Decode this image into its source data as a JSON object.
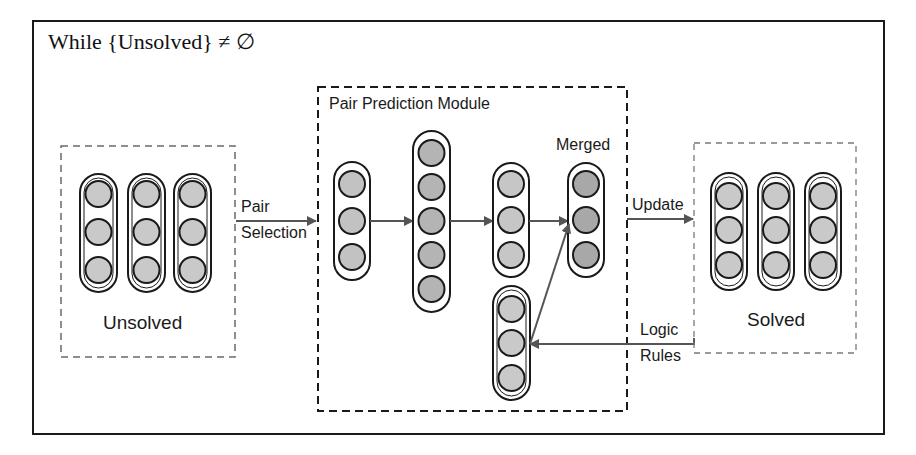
{
  "diagram": {
    "loop_condition": "While {Unsolved} ≠ ∅",
    "groups": {
      "unsolved": {
        "label": "Unsolved",
        "columns": 3,
        "nodes_per_column": 3
      },
      "pair_prediction_module": {
        "label": "Pair Prediction Module",
        "layers": [
          {
            "id": "input",
            "nodes": 3
          },
          {
            "id": "hidden",
            "nodes": 5
          },
          {
            "id": "output",
            "nodes": 3
          },
          {
            "id": "merged",
            "label": "Merged",
            "nodes": 3
          },
          {
            "id": "rule-input",
            "nodes": 3
          }
        ]
      },
      "solved": {
        "label": "Solved",
        "columns": 3,
        "nodes_per_column": 3
      }
    },
    "edges": {
      "pair_selection": {
        "line1": "Pair",
        "line2": "Selection"
      },
      "update": {
        "label": "Update"
      },
      "logic_rules": {
        "line1": "Logic",
        "line2": "Rules"
      }
    },
    "colors": {
      "node_fill_light": "#c9c9c9",
      "node_fill_dark": "#aaaaaa",
      "stroke": "#1a1a1a",
      "arrow": "#555555",
      "dashed_light": "#7a7a7a"
    }
  }
}
